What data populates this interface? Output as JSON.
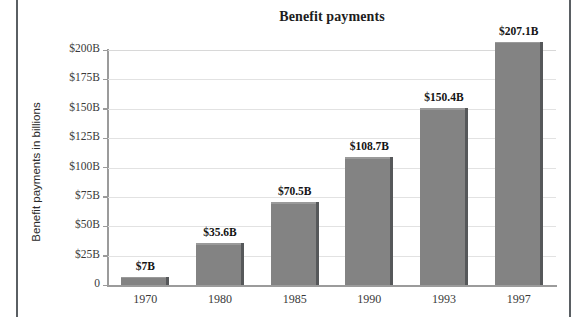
{
  "chart_data": {
    "type": "bar",
    "title": "Benefit payments",
    "xlabel": "",
    "ylabel": "Benefit payments in billions",
    "categories": [
      "1970",
      "1980",
      "1985",
      "1990",
      "1993",
      "1997"
    ],
    "values": [
      7,
      35.6,
      70.5,
      108.7,
      150.4,
      207.1
    ],
    "value_labels": [
      "$7B",
      "$35.6B",
      "$70.5B",
      "$108.7B",
      "$150.4B",
      "$207.1B"
    ],
    "ylim": [
      0,
      200
    ],
    "ytick_values": [
      0,
      25,
      50,
      75,
      100,
      125,
      150,
      175,
      200
    ],
    "ytick_labels": [
      "0",
      "$25B",
      "$50B",
      "$75B",
      "$100B",
      "$125B",
      "$150B",
      "$175B",
      "$200B"
    ],
    "grid": true,
    "legend": "none",
    "bar_color": "#838383",
    "bar_edge_color": "#56585a",
    "gridline_color": "#e2e2e2",
    "axis_color": "#9b9b9b",
    "text_color": "#1d1d1d",
    "frame_color": "#5a5f63"
  }
}
